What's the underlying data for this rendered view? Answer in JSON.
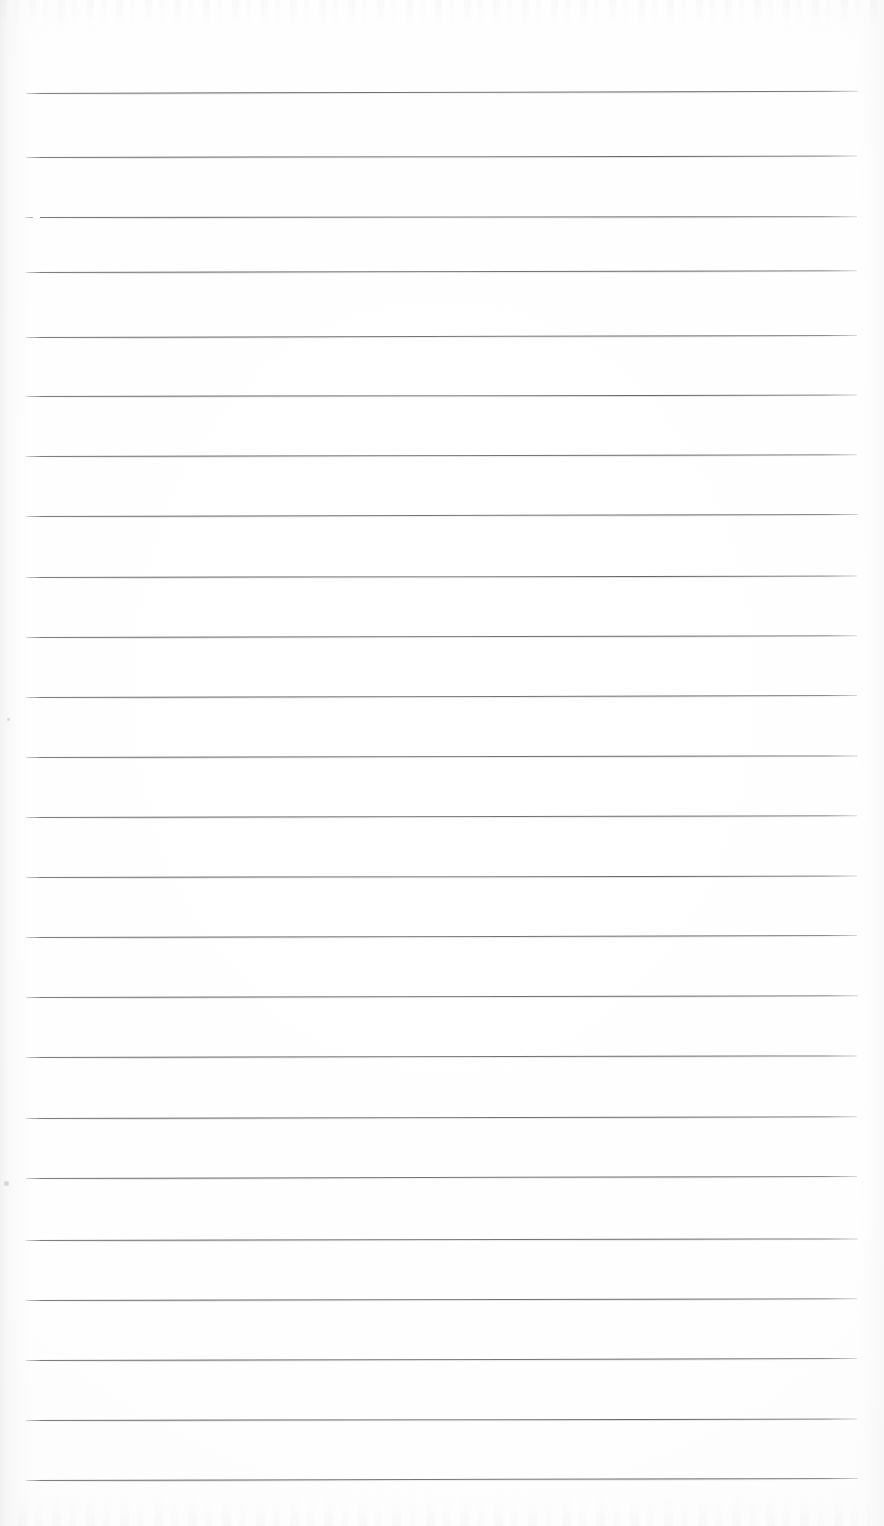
{
  "document": {
    "type": "scanned-lined-paper",
    "title": "Blank ruled notepad page",
    "orientation": "portrait",
    "page_width": 884,
    "page_height": 1526,
    "background_color": "#fdfdfd",
    "rule_color": "#606064",
    "text_content": "",
    "is_blank": true
  },
  "ruling": {
    "line_count": 24,
    "line_spacing": 60.3,
    "first_line_y": 93,
    "last_line_y": 1480,
    "line_start_x": 26,
    "line_end_x": 858,
    "line_thickness": 1,
    "skew_degrees": -0.12,
    "lines": [
      {
        "index": 1,
        "y": 93,
        "start_x": 26,
        "end_x": 858,
        "skew": -0.16
      },
      {
        "index": 2,
        "y": 157,
        "start_x": 26,
        "end_x": 857,
        "skew": -0.1
      },
      {
        "index": 3,
        "y": 217,
        "start_x": 25,
        "end_x": 857,
        "skew": -0.06,
        "broken_start": true
      },
      {
        "index": 4,
        "y": 272,
        "start_x": 26,
        "end_x": 857,
        "skew": -0.12
      },
      {
        "index": 5,
        "y": 337,
        "start_x": 26,
        "end_x": 857,
        "skew": -0.14
      },
      {
        "index": 6,
        "y": 396,
        "start_x": 26,
        "end_x": 857,
        "skew": -0.1
      },
      {
        "index": 7,
        "y": 456,
        "start_x": 26,
        "end_x": 857,
        "skew": -0.12
      },
      {
        "index": 8,
        "y": 516,
        "start_x": 26,
        "end_x": 858,
        "skew": -0.14
      },
      {
        "index": 9,
        "y": 577,
        "start_x": 26,
        "end_x": 857,
        "skew": -0.1
      },
      {
        "index": 10,
        "y": 637,
        "start_x": 26,
        "end_x": 857,
        "skew": -0.12
      },
      {
        "index": 11,
        "y": 697,
        "start_x": 26,
        "end_x": 857,
        "skew": -0.13
      },
      {
        "index": 12,
        "y": 757,
        "start_x": 26,
        "end_x": 858,
        "skew": -0.11
      },
      {
        "index": 13,
        "y": 817,
        "start_x": 26,
        "end_x": 857,
        "skew": -0.12
      },
      {
        "index": 14,
        "y": 877,
        "start_x": 26,
        "end_x": 857,
        "skew": -0.1
      },
      {
        "index": 15,
        "y": 937,
        "start_x": 26,
        "end_x": 857,
        "skew": -0.13
      },
      {
        "index": 16,
        "y": 997,
        "start_x": 26,
        "end_x": 858,
        "skew": -0.12
      },
      {
        "index": 17,
        "y": 1057,
        "start_x": 26,
        "end_x": 857,
        "skew": -0.11
      },
      {
        "index": 18,
        "y": 1118,
        "start_x": 26,
        "end_x": 857,
        "skew": -0.12
      },
      {
        "index": 19,
        "y": 1178,
        "start_x": 26,
        "end_x": 857,
        "skew": -0.14
      },
      {
        "index": 20,
        "y": 1240,
        "start_x": 26,
        "end_x": 858,
        "skew": -0.11
      },
      {
        "index": 21,
        "y": 1300,
        "start_x": 26,
        "end_x": 857,
        "skew": -0.12
      },
      {
        "index": 22,
        "y": 1360,
        "start_x": 26,
        "end_x": 857,
        "skew": -0.13
      },
      {
        "index": 23,
        "y": 1420,
        "start_x": 26,
        "end_x": 857,
        "skew": -0.1
      },
      {
        "index": 24,
        "y": 1480,
        "start_x": 26,
        "end_x": 858,
        "skew": -0.14
      }
    ]
  },
  "artifacts": {
    "edge_shadow_left": true,
    "edge_shadow_right": true,
    "ghost_text_top": true,
    "ghost_text_bottom": true,
    "specks": [
      {
        "x": 4,
        "y": 1181,
        "size": 5
      },
      {
        "x": 7,
        "y": 718,
        "size": 3
      }
    ]
  }
}
